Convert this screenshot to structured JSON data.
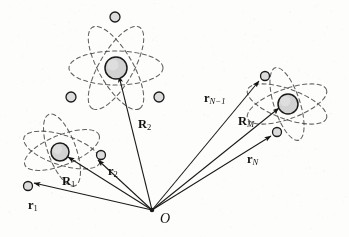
{
  "figure": {
    "background_color": "#fdfdfc",
    "ink_color": "#1a1a1a",
    "nucleus_fill": "#d2d2d2",
    "electron_fill": "#dcdcdc",
    "orbit_color": "#4a4a4a"
  },
  "origin": {
    "label": "O",
    "x": 152,
    "y": 210
  },
  "labels": {
    "r1": {
      "symbol": "r",
      "subscript": "1",
      "sub_style": "number",
      "x": 28,
      "y": 196
    },
    "r2": {
      "symbol": "r",
      "subscript": "2",
      "sub_style": "number",
      "x": 108,
      "y": 162
    },
    "R1": {
      "symbol": "R",
      "subscript": "1",
      "sub_style": "number",
      "x": 62,
      "y": 172
    },
    "R2": {
      "symbol": "R",
      "subscript": "2",
      "sub_style": "number",
      "x": 138,
      "y": 115
    },
    "RM": {
      "symbol": "R",
      "subscript": "M",
      "sub_style": "italic",
      "x": 238,
      "y": 112
    },
    "rN1": {
      "symbol": "r",
      "subscript": "N−1",
      "sub_style": "italic",
      "x": 204,
      "y": 89
    },
    "rN": {
      "symbol": "r",
      "subscript": "N",
      "sub_style": "italic",
      "x": 247,
      "y": 150
    }
  },
  "atoms": [
    {
      "name": "atom-1",
      "nucleus": {
        "x": 60,
        "y": 152,
        "r": 9
      },
      "electrons": [
        {
          "name": "electron-r1",
          "x": 28,
          "y": 186,
          "r": 4.5
        },
        {
          "name": "electron-r2",
          "x": 101,
          "y": 155,
          "r": 4.5
        }
      ],
      "orbits": [
        {
          "cx": 62,
          "cy": 150,
          "rx": 40,
          "ry": 15,
          "rot": 18
        },
        {
          "cx": 62,
          "cy": 150,
          "rx": 40,
          "ry": 15,
          "rot": -22
        },
        {
          "cx": 62,
          "cy": 150,
          "rx": 38,
          "ry": 14,
          "rot": 70
        }
      ]
    },
    {
      "name": "atom-2",
      "nucleus": {
        "x": 116,
        "y": 68,
        "r": 11
      },
      "electrons": [
        {
          "name": "electron-top",
          "x": 115,
          "y": 17,
          "r": 5
        },
        {
          "name": "electron-left",
          "x": 71,
          "y": 97,
          "r": 5
        },
        {
          "name": "electron-right",
          "x": 159,
          "y": 97,
          "r": 5
        }
      ],
      "orbits": [
        {
          "cx": 116,
          "cy": 68,
          "rx": 47,
          "ry": 17,
          "rot": 0
        },
        {
          "cx": 116,
          "cy": 68,
          "rx": 47,
          "ry": 17,
          "rot": 60
        },
        {
          "cx": 116,
          "cy": 68,
          "rx": 47,
          "ry": 17,
          "rot": 120
        }
      ]
    },
    {
      "name": "atom-M",
      "nucleus": {
        "x": 288,
        "y": 104,
        "r": 10
      },
      "electrons": [
        {
          "name": "electron-rN1",
          "x": 265,
          "y": 76,
          "r": 4.5
        },
        {
          "name": "electron-rN",
          "x": 277,
          "y": 132,
          "r": 4.5
        }
      ],
      "orbits": [
        {
          "cx": 287,
          "cy": 104,
          "rx": 42,
          "ry": 15,
          "rot": 20
        },
        {
          "cx": 287,
          "cy": 104,
          "rx": 42,
          "ry": 15,
          "rot": -20
        },
        {
          "cx": 287,
          "cy": 104,
          "rx": 38,
          "ry": 13,
          "rot": 72
        }
      ]
    }
  ],
  "vectors": [
    {
      "name": "vector-r1",
      "label_key": "r1",
      "to_x": 34,
      "to_y": 183
    },
    {
      "name": "vector-R1",
      "label_key": "R1",
      "to_x": 68,
      "to_y": 157
    },
    {
      "name": "vector-r2",
      "label_key": "r2",
      "to_x": 98,
      "to_y": 160
    },
    {
      "name": "vector-R2",
      "label_key": "R2",
      "to_x": 119,
      "to_y": 76
    },
    {
      "name": "vector-rN1",
      "label_key": "rN1",
      "to_x": 259,
      "to_y": 81
    },
    {
      "name": "vector-RM",
      "label_key": "RM",
      "to_x": 279,
      "to_y": 108
    },
    {
      "name": "vector-rN",
      "label_key": "rN",
      "to_x": 271,
      "to_y": 136
    }
  ]
}
